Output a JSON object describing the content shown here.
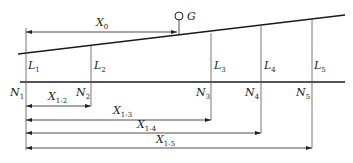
{
  "diagram": {
    "top_line": {
      "x1": 18,
      "y1": 54,
      "x2": 345,
      "y2": 15
    },
    "base_line": {
      "x1": 20,
      "y1": 82,
      "x2": 345,
      "y2": 82
    },
    "gauge": {
      "label": "G",
      "cx": 179,
      "cy": 16,
      "r": 4,
      "stem_bottom": 34
    },
    "x0": {
      "label_main": "X",
      "label_sub": "0",
      "x1": 26,
      "x2": 177,
      "y": 32,
      "label_x": 96,
      "label_y": 26
    },
    "verticals": [
      {
        "id": "1",
        "x": 26,
        "top": 28,
        "bottom": 150,
        "L_main": "L",
        "L_sub": "1",
        "N_main": "N",
        "N_sub": "1",
        "L_x": 28,
        "L_y": 69,
        "N_x": 10,
        "N_y": 96
      },
      {
        "id": "2",
        "x": 91,
        "top": 46,
        "bottom": 106,
        "L_main": "L",
        "L_sub": "2",
        "N_main": "N",
        "N_sub": "2",
        "L_x": 94,
        "L_y": 69,
        "N_x": 76,
        "N_y": 96
      },
      {
        "id": "3",
        "x": 211,
        "top": 33,
        "bottom": 120,
        "L_main": "L",
        "L_sub": "3",
        "N_main": "N",
        "N_sub": "3",
        "L_x": 214,
        "L_y": 69,
        "N_x": 196,
        "N_y": 96
      },
      {
        "id": "4",
        "x": 261,
        "top": 26,
        "bottom": 133,
        "L_main": "L",
        "L_sub": "4",
        "N_main": "N",
        "N_sub": "4",
        "L_x": 264,
        "L_y": 69,
        "N_x": 245,
        "N_y": 96
      },
      {
        "id": "5",
        "x": 312,
        "top": 18,
        "bottom": 148,
        "L_main": "L",
        "L_sub": "5",
        "N_main": "N",
        "N_sub": "5",
        "L_x": 314,
        "L_y": 69,
        "N_x": 296,
        "N_y": 96
      }
    ],
    "dimensions": [
      {
        "label_main": "X",
        "label_sub": "1-2",
        "x1": 26,
        "x2": 91,
        "y": 106,
        "label_x": 48,
        "label_y": 100
      },
      {
        "label_main": "X",
        "label_sub": "1-3",
        "x1": 26,
        "x2": 211,
        "y": 120,
        "label_x": 113,
        "label_y": 114
      },
      {
        "label_main": "X",
        "label_sub": "1-4",
        "x1": 26,
        "x2": 261,
        "y": 133,
        "label_x": 137,
        "label_y": 128
      },
      {
        "label_main": "X",
        "label_sub": "1-5",
        "x1": 26,
        "x2": 312,
        "y": 148,
        "label_x": 156,
        "label_y": 143
      }
    ],
    "colors": {
      "stroke": "#1a1a1a",
      "thin": "#555555",
      "background": "#ffffff"
    }
  }
}
